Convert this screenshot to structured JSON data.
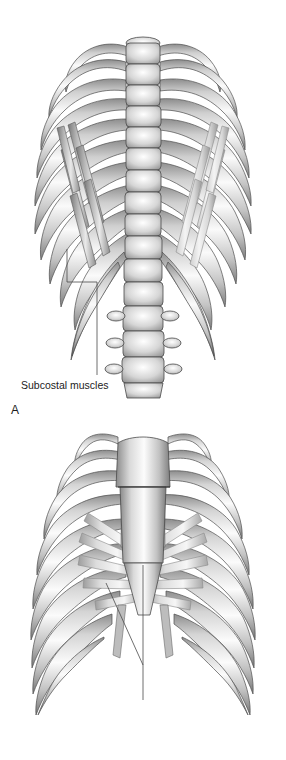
{
  "figure": {
    "background_color": "#ffffff",
    "ink_color": "#1c1c1c",
    "bone_light": "#f2f2f2",
    "bone_mid": "#b9b9b9",
    "bone_dark": "#6e6e6e",
    "muscle_light": "#e2e2e2",
    "muscle_mid": "#a8a8a8",
    "leader_color": "#4a4a4a"
  },
  "panels": [
    {
      "letter": "A",
      "view": "posterior view of thoracic cage",
      "subject": "vertebral-column-and-ribs",
      "rib_pairs": 11,
      "vertebrae_visible": 16,
      "label": {
        "text": "Subcostal muscles",
        "target": "diagonal muscle bands spanning inner rib surfaces"
      }
    },
    {
      "letter": "B",
      "view": "anterior view of thoracic cage",
      "subject": "sternum-and-ribs",
      "rib_pairs": 10,
      "label": {
        "text": "Transversus thoracis muscle",
        "target": "fan-shaped muscle radiating from lower sternum"
      }
    }
  ],
  "labels": {
    "panel_a_letter": "A",
    "panel_b_letter": "B",
    "subcostal": "Subcostal muscles",
    "transversus": "Transversus thoracis muscle"
  }
}
